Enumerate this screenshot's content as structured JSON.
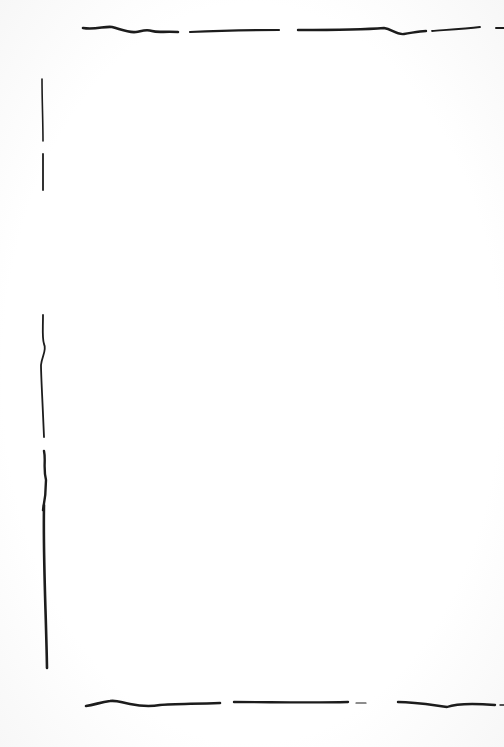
{
  "page": {
    "background_color": "#ffffff",
    "ink_color": "#1c1c1c"
  },
  "strokes": {
    "top": [
      {
        "d": "M83 28 C95 30 105 26 112 27 C120 29 128 33 136 32 C142 31 146 29 152 31 C158 33 164 31 178 32",
        "w": 2.6
      },
      {
        "d": "M190 32 C210 31 240 30 279 30",
        "w": 2.2
      },
      {
        "d": "M298 30 C330 30 360 30 384 28 C392 29 396 35 404 34 C412 33 418 31 426 31",
        "w": 2.4
      },
      {
        "d": "M432 31 C445 30 465 29 480 27",
        "w": 1.8
      },
      {
        "d": "M496 28 L504 28",
        "w": 2.0
      }
    ],
    "left": [
      {
        "d": "M42 79 C42 100 43 122 43 141",
        "w": 1.6
      },
      {
        "d": "M43 154 C43 165 43 178 43 190",
        "w": 1.8
      },
      {
        "d": "M43 315 C43 330 42 338 44 344 C47 350 42 356 41 365 C41 375 42 390 44 437",
        "w": 1.8
      },
      {
        "d": "M44 451 C46 460 43 468 46 480 C46 490 45 500 43 510",
        "w": 2.4
      },
      {
        "d": "M44 505 C43 560 46 610 47 668",
        "w": 2.6
      }
    ],
    "bottom": [
      {
        "d": "M86 706 C95 705 100 702 110 701 C118 700 122 703 130 704 C140 706 148 707 160 705 C172 704 190 704 220 703",
        "w": 2.6
      },
      {
        "d": "M234 702 C270 702 310 703 348 702",
        "w": 2.4
      },
      {
        "d": "M356 703 L366 703",
        "w": 1.2
      },
      {
        "d": "M398 702 C415 702 432 705 447 707 C455 704 470 703 495 705",
        "w": 2.4
      },
      {
        "d": "M500 705 L504 705",
        "w": 1.4
      }
    ]
  }
}
